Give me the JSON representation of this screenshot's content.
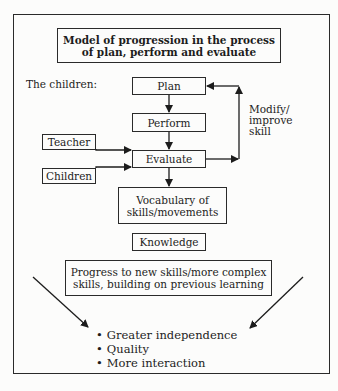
{
  "diagram": {
    "title": "Model of progression in the process\nof plan, perform and evaluate",
    "subject_label": "The children:",
    "nodes": {
      "plan": "Plan",
      "perform": "Perform",
      "evaluate": "Evaluate",
      "teacher": "Teacher",
      "children": "Children",
      "vocabulary": "Vocabulary of\nskills/movements",
      "knowledge": "Knowledge",
      "progress": "Progress to new skills/more complex\nskills, building on previous learning"
    },
    "feedback_label": "Modify/\nimprove\nskill",
    "outcomes": [
      "Greater independence",
      "Quality",
      "More interaction"
    ],
    "edges": [
      {
        "from": "plan",
        "to": "perform"
      },
      {
        "from": "perform",
        "to": "evaluate"
      },
      {
        "from": "teacher",
        "to": "evaluate"
      },
      {
        "from": "children",
        "to": "evaluate"
      },
      {
        "from": "evaluate",
        "to": "vocabulary"
      },
      {
        "from": "evaluate",
        "to": "plan",
        "label": "Modify/ improve skill"
      },
      {
        "from": "left-margin",
        "to": "outcomes"
      },
      {
        "from": "right-margin",
        "to": "outcomes"
      }
    ],
    "colors": {
      "line": "#2a2a2a",
      "background": "#fcfcfb",
      "text": "#1c1c1c"
    }
  }
}
